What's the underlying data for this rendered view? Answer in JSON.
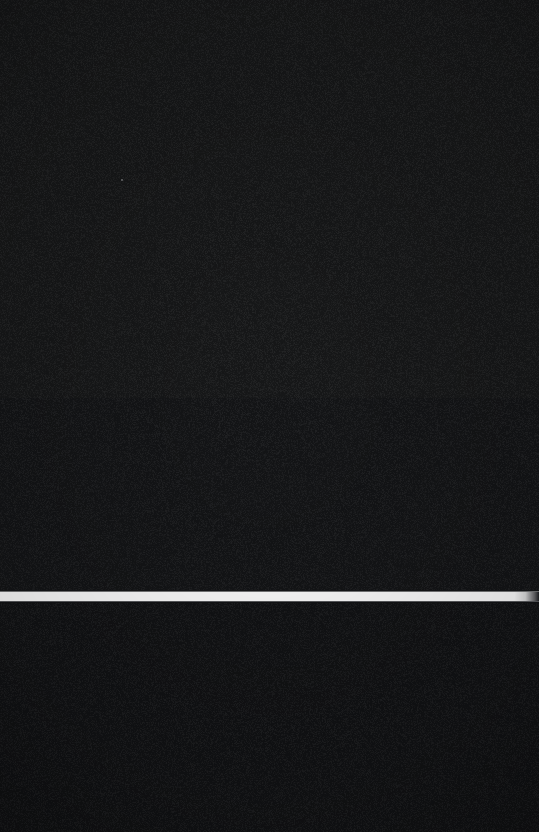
{
  "screen": {
    "width_px": 539,
    "height_px": 832,
    "description": "Near-black screen capture with no legible interface content",
    "background_color": "#15161a"
  },
  "regions": {
    "upper_panel": {
      "name": "upper-dark-area",
      "color": "#171819",
      "top_px": 0,
      "height_px": 398,
      "text": ""
    },
    "upper_lower_panel": {
      "name": "mid-dark-area",
      "color": "#141517",
      "top_px": 398,
      "height_px": 194,
      "text": ""
    },
    "lower_panel": {
      "name": "lower-dark-area",
      "color": "#121315",
      "top_px": 602,
      "height_px": 230,
      "text": ""
    }
  },
  "divider": {
    "name": "white-horizontal-band",
    "color": "#ffffff",
    "top_px": 592,
    "height_px": 9,
    "left_px": 0,
    "width_px": 539,
    "right_edge_fade": true,
    "label": ""
  },
  "artifacts": {
    "speck": {
      "name": "faint-pixel-speck",
      "x_px": 121,
      "y_px": 179,
      "color": "#bebec3"
    }
  },
  "content": {
    "visible_text": "",
    "icons": [],
    "controls": []
  }
}
